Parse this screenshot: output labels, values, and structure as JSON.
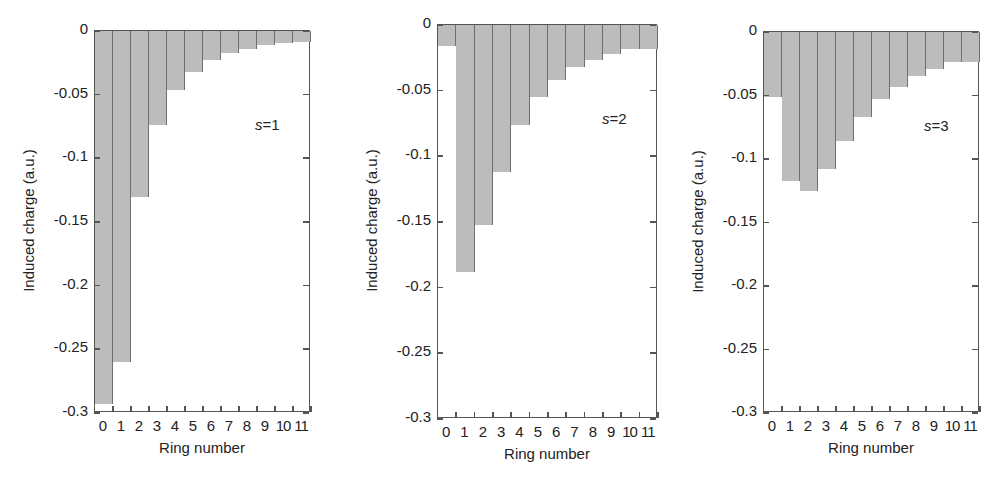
{
  "chart_data": [
    {
      "type": "bar",
      "title": "",
      "annotation_var": "s",
      "annotation_eq": "=",
      "annotation_val": "1",
      "xlabel": "Ring number",
      "ylabel": "Induced charge (a.u.)",
      "ylim": [
        -0.3,
        0
      ],
      "yticks": [
        "0",
        "-0.05",
        "-0.1",
        "-0.15",
        "-0.2",
        "-0.25",
        "-0.3"
      ],
      "categories": [
        "0",
        "1",
        "2",
        "3",
        "4",
        "5",
        "6",
        "7",
        "8",
        "9",
        "10",
        "11"
      ],
      "values": [
        -0.293,
        -0.26,
        -0.13,
        -0.074,
        -0.046,
        -0.032,
        -0.023,
        -0.017,
        -0.014,
        -0.011,
        -0.0095,
        -0.009
      ],
      "grid": false,
      "bar_color": "#bcbcbc"
    },
    {
      "type": "bar",
      "title": "",
      "annotation_var": "s",
      "annotation_eq": "=",
      "annotation_val": "2",
      "xlabel": "Ring number",
      "ylabel": "Induced charge (a.u.)",
      "ylim": [
        -0.3,
        0
      ],
      "yticks": [
        "0",
        "-0.05",
        "-0.1",
        "-0.15",
        "-0.2",
        "-0.25",
        "-0.3"
      ],
      "categories": [
        "0",
        "1",
        "2",
        "3",
        "4",
        "5",
        "6",
        "7",
        "8",
        "9",
        "10",
        "11"
      ],
      "values": [
        -0.016,
        -0.188,
        -0.152,
        -0.112,
        -0.076,
        -0.055,
        -0.042,
        -0.032,
        -0.027,
        -0.022,
        -0.018,
        -0.018
      ],
      "grid": false,
      "bar_color": "#bcbcbc"
    },
    {
      "type": "bar",
      "title": "",
      "annotation_var": "s",
      "annotation_eq": "=",
      "annotation_val": "3",
      "xlabel": "Ring number",
      "ylabel": "Induced charge (a.u.)",
      "ylim": [
        -0.3,
        0
      ],
      "yticks": [
        "0",
        "-0.05",
        "-0.1",
        "-0.15",
        "-0.2",
        "-0.25",
        "-0.3"
      ],
      "categories": [
        "0",
        "1",
        "2",
        "3",
        "4",
        "5",
        "6",
        "7",
        "8",
        "9",
        "10",
        "11"
      ],
      "values": [
        -0.051,
        -0.117,
        -0.125,
        -0.108,
        -0.086,
        -0.067,
        -0.053,
        -0.043,
        -0.035,
        -0.029,
        -0.024,
        -0.024
      ],
      "grid": false,
      "bar_color": "#bcbcbc"
    }
  ],
  "layout": [
    {
      "left": 94,
      "top": 30,
      "width": 216,
      "height": 382
    },
    {
      "left": 437,
      "top": 24,
      "width": 220,
      "height": 394
    },
    {
      "left": 763,
      "top": 31,
      "width": 216,
      "height": 381
    }
  ]
}
